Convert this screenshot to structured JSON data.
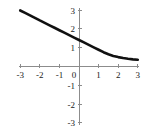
{
  "chart_data": {
    "type": "line",
    "title": "",
    "subtitle": "",
    "xlabel": "",
    "ylabel": "",
    "xlim": [
      -3,
      3
    ],
    "ylim": [
      -3,
      3
    ],
    "grid": false,
    "legend": false,
    "legend_position": "none",
    "x_ticks": [
      -3,
      -2,
      -1,
      0,
      1,
      2,
      3
    ],
    "y_ticks": [
      -3,
      -2,
      -1,
      1,
      2,
      3
    ],
    "x_tick_labels": [
      "-3",
      "-2",
      "-1",
      "0",
      "1",
      "2",
      "3"
    ],
    "y_tick_labels": [
      "-3",
      "-2",
      "-1",
      "1",
      "2",
      "3"
    ],
    "series": [
      {
        "name": "curve",
        "color": "#111111",
        "x": [
          -3.0,
          -2.75,
          -2.5,
          -2.25,
          -2.0,
          -1.75,
          -1.5,
          -1.25,
          -1.0,
          -0.75,
          -0.5,
          -0.25,
          0.0,
          0.25,
          0.5,
          0.75,
          1.0,
          1.25,
          1.5,
          1.75,
          2.0,
          2.25,
          2.5,
          2.75,
          3.0
        ],
        "y": [
          2.98,
          2.85,
          2.72,
          2.59,
          2.45,
          2.32,
          2.19,
          2.06,
          1.93,
          1.8,
          1.67,
          1.54,
          1.41,
          1.28,
          1.15,
          1.02,
          0.89,
          0.76,
          0.65,
          0.56,
          0.5,
          0.45,
          0.41,
          0.38,
          0.36
        ]
      }
    ],
    "annotations": []
  },
  "axes": {
    "x_axis_name": "horizontal-axis",
    "y_axis_name": "vertical-axis",
    "axis_color": "#8c8c8c"
  },
  "geometry": {
    "origin_x_px": 79,
    "origin_y_px": 66.5,
    "unit_x_px": 19.6,
    "unit_y_px": 18.8
  }
}
